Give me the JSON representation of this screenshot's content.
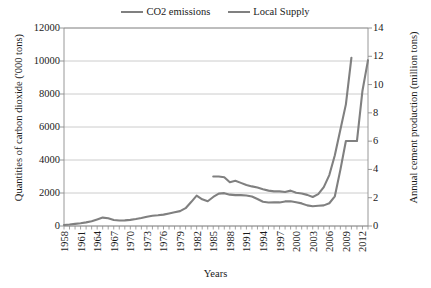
{
  "legend": {
    "position": "top-center",
    "entries": [
      {
        "label": "CO2 emissions",
        "color": "#808080"
      },
      {
        "label": "Local Supply",
        "color": "#808080"
      }
    ]
  },
  "axis_titles": {
    "left": "Quantities of carbon dioxide ('000 tons)",
    "right": "Annual cement production (million tons)",
    "x": "Years"
  },
  "chart_data": {
    "type": "line",
    "title": "",
    "xlabel": "Years",
    "ylabel": "Quantities of carbon dioxide ('000 tons)",
    "y2label": "Annual cement production (million tons)",
    "xlim": [
      1958,
      2013
    ],
    "ylim": [
      0,
      12000
    ],
    "y2lim": [
      0,
      14
    ],
    "ytick_labels": [
      "12000",
      "10000",
      "8000",
      "6000",
      "4000",
      "2000",
      "0"
    ],
    "ytick_values": [
      12000,
      10000,
      8000,
      6000,
      4000,
      2000,
      0
    ],
    "y2tick_labels": [
      "14",
      "12",
      "10",
      "8",
      "6",
      "4",
      "2",
      "0"
    ],
    "y2tick_values": [
      14,
      12,
      10,
      8,
      6,
      4,
      2,
      0
    ],
    "xtick_labels": [
      "1958",
      "1961",
      "1964",
      "1967",
      "1970",
      "1973",
      "1976",
      "1979",
      "1982",
      "1985",
      "1988",
      "1991",
      "1994",
      "1997",
      "2000",
      "2003",
      "2006",
      "2009",
      "2012"
    ],
    "xtick_values": [
      1958,
      1961,
      1964,
      1967,
      1970,
      1973,
      1976,
      1979,
      1982,
      1985,
      1988,
      1991,
      1994,
      1997,
      2000,
      2003,
      2006,
      2009,
      2012
    ],
    "grid": "horizontal",
    "legend_position": "top-center",
    "series": [
      {
        "name": "CO2 emissions",
        "axis": "left",
        "color": "#808080",
        "x": [
          1958,
          1959,
          1960,
          1961,
          1962,
          1963,
          1964,
          1965,
          1966,
          1967,
          1968,
          1969,
          1970,
          1971,
          1972,
          1973,
          1974,
          1975,
          1976,
          1977,
          1978,
          1979,
          1980,
          1981,
          1982,
          1983,
          1984,
          1985,
          1986,
          1987,
          1988,
          1989,
          1990,
          1991,
          1992,
          1993,
          1994,
          1995,
          1996,
          1997,
          1998,
          1999,
          2000,
          2001,
          2002,
          2003,
          2004,
          2005,
          2006,
          2007,
          2008,
          2009,
          2010,
          2011,
          2012,
          2013
        ],
        "values": [
          60,
          90,
          130,
          170,
          220,
          290,
          400,
          510,
          470,
          360,
          330,
          340,
          370,
          420,
          480,
          560,
          620,
          650,
          690,
          760,
          830,
          900,
          1080,
          1450,
          1840,
          1620,
          1500,
          1760,
          1960,
          1990,
          1900,
          1870,
          1870,
          1850,
          1790,
          1640,
          1470,
          1420,
          1430,
          1430,
          1490,
          1500,
          1440,
          1370,
          1250,
          1200,
          1230,
          1250,
          1380,
          1800,
          3400,
          5150,
          5150,
          5150,
          8200,
          10050
        ]
      },
      {
        "name": "Local Supply",
        "axis": "right",
        "color": "#808080",
        "x": [
          1985,
          1986,
          1987,
          1988,
          1989,
          1990,
          1991,
          1992,
          1993,
          1994,
          1995,
          1996,
          1997,
          1998,
          1999,
          2000,
          2001,
          2002,
          2003,
          2004,
          2005,
          2006,
          2007,
          2008,
          2009,
          2010
        ],
        "values": [
          3.5,
          3.5,
          3.45,
          3.1,
          3.2,
          3.05,
          2.9,
          2.8,
          2.72,
          2.6,
          2.5,
          2.45,
          2.45,
          2.4,
          2.5,
          2.35,
          2.3,
          2.2,
          2.05,
          2.25,
          2.75,
          3.6,
          5.0,
          6.8,
          8.6,
          11.9
        ]
      }
    ]
  }
}
